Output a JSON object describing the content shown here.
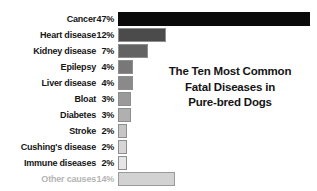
{
  "chart_data": {
    "type": "bar",
    "orientation": "horizontal",
    "title_lines": [
      "The Ten Most Common",
      "Fatal Diseases in",
      "Pure-bred Dogs"
    ],
    "xlabel": "",
    "ylabel": "",
    "grid": false,
    "legend": "none",
    "xlim": [
      0,
      47
    ],
    "value_unit": "%",
    "categories": [
      "Cancer",
      "Heart disease",
      "Kidney disease",
      "Epilepsy",
      "Liver disease",
      "Bloat",
      "Diabetes",
      "Stroke",
      "Cushing's disease",
      "Immune diseases",
      "Other causes"
    ],
    "values": [
      47,
      12,
      7,
      4,
      4,
      3,
      3,
      2,
      2,
      2,
      14
    ],
    "value_labels": [
      "47%",
      "12%",
      "7%",
      "4%",
      "4%",
      "3%",
      "3%",
      "2%",
      "2%",
      "2%",
      "14%"
    ],
    "bar_colors": [
      "#0a0a0a",
      "#4b4b4b",
      "#636363",
      "#787878",
      "#8a8a8a",
      "#9a9a9a",
      "#b0b0b0",
      "#c6c6c6",
      "#d6d6d6",
      "#e6e6e6",
      "#d2d2d2"
    ],
    "bar_pixel_widths": [
      192,
      48,
      30,
      15,
      15,
      13,
      13,
      9,
      9,
      9,
      57
    ],
    "rows": [
      {
        "label": "Cancer",
        "value_label": "47%",
        "value": 47,
        "color": "#0a0a0a",
        "width": 192,
        "muted": false
      },
      {
        "label": "Heart disease",
        "value_label": "12%",
        "value": 12,
        "color": "#4b4b4b",
        "width": 48,
        "muted": false
      },
      {
        "label": "Kidney disease",
        "value_label": "7%",
        "value": 7,
        "color": "#636363",
        "width": 30,
        "muted": false
      },
      {
        "label": "Epilepsy",
        "value_label": "4%",
        "value": 4,
        "color": "#787878",
        "width": 15,
        "muted": false
      },
      {
        "label": "Liver disease",
        "value_label": "4%",
        "value": 4,
        "color": "#8a8a8a",
        "width": 15,
        "muted": false
      },
      {
        "label": "Bloat",
        "value_label": "3%",
        "value": 3,
        "color": "#9a9a9a",
        "width": 13,
        "muted": false
      },
      {
        "label": "Diabetes",
        "value_label": "3%",
        "value": 3,
        "color": "#b0b0b0",
        "width": 13,
        "muted": false
      },
      {
        "label": "Stroke",
        "value_label": "2%",
        "value": 2,
        "color": "#c6c6c6",
        "width": 9,
        "muted": false
      },
      {
        "label": "Cushing's disease",
        "value_label": "2%",
        "value": 2,
        "color": "#d6d6d6",
        "width": 9,
        "muted": false
      },
      {
        "label": "Immune diseases",
        "value_label": "2%",
        "value": 2,
        "color": "#e6e6e6",
        "width": 9,
        "muted": false
      },
      {
        "label": "Other causes",
        "value_label": "14%",
        "value": 14,
        "color": "#d2d2d2",
        "width": 57,
        "muted": true
      }
    ],
    "background_color": "#ffffff",
    "text_color": "#151515",
    "muted_text_color": "#b4b4b4"
  }
}
